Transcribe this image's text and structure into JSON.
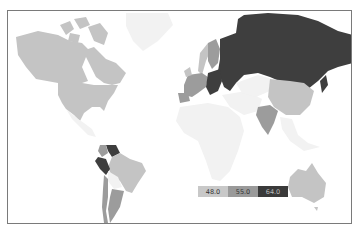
{
  "map": {
    "type": "world-choropleth",
    "colors": {
      "low": "#c4c4c4",
      "mid": "#9c9c9c",
      "high": "#3e3e3e",
      "nodata": "#f2f2f2",
      "border": "#ffffff",
      "frame": "#7a7a7a"
    }
  },
  "legend": {
    "items": [
      {
        "label": "48.0",
        "color": "#c8c8c8"
      },
      {
        "label": "55.0",
        "color": "#9a9a9a"
      },
      {
        "label": "64.0",
        "color": "#3a3a3a"
      }
    ]
  }
}
